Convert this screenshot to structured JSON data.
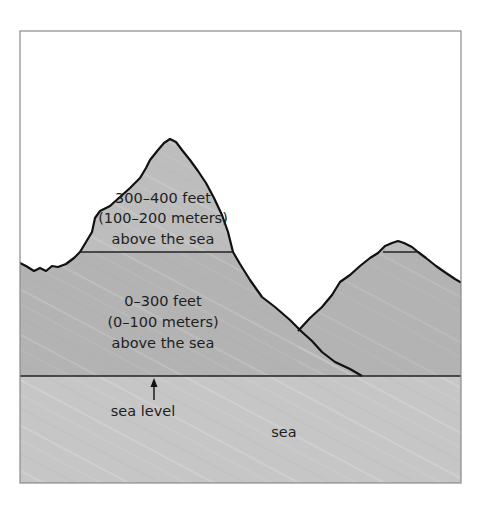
{
  "diagram": {
    "colors": {
      "sky": "#ffffff",
      "frame": "#8a8a8a",
      "land": "#b3b3b3",
      "upper_land": "#bdbdbd",
      "sea": "#c6c6c6",
      "outline": "#111111"
    },
    "upper_band": {
      "line1": "300–400 feet",
      "line2": "(100–200 meters)",
      "line3": "above the sea"
    },
    "lower_band": {
      "line1": "0–300 feet",
      "line2": "(0–100 meters)",
      "line3": "above the sea"
    },
    "sea_level_label": "sea level",
    "sea_label": "sea",
    "icons": {
      "sea_level_pointer": "up-arrow-icon"
    }
  }
}
